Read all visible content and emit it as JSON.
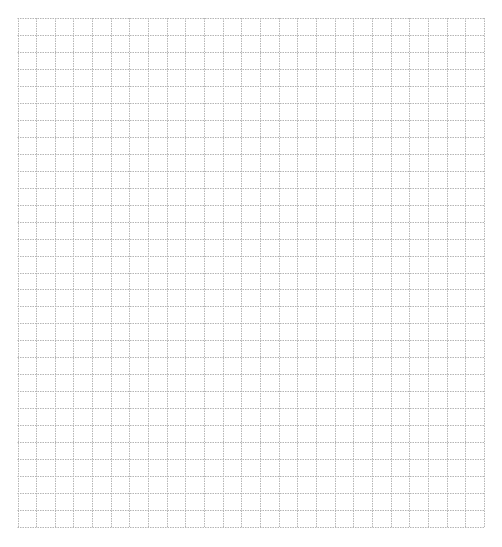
{
  "page": {
    "grid": {
      "columns": 25,
      "rows": 30,
      "line_color": "#b5b5b5",
      "line_style": "dotted",
      "background": "#ffffff"
    }
  }
}
